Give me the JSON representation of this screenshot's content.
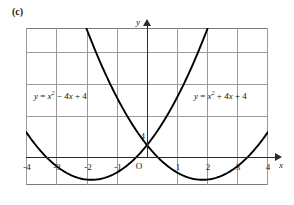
{
  "figure": {
    "part_label": "(c)",
    "background_color": "#ffffff",
    "curve_color": "#000000",
    "grid_color": "#9a9a9a",
    "frame_color": "#7a7a7a",
    "axis_color": "#2b2b2b"
  },
  "axes": {
    "x_axis_label": "x",
    "y_axis_label": "y",
    "origin_label": "O",
    "y_intercept_label": "4",
    "x_ticks": [
      "-4",
      "-3",
      "-2",
      "-1",
      "1",
      "2",
      "3",
      "4"
    ],
    "x_tick_values": [
      -4,
      -3,
      -2,
      -1,
      1,
      2,
      3,
      4
    ]
  },
  "equations": {
    "left": {
      "lhs": "y",
      "eq": "=",
      "var": "x",
      "exp": "2",
      "mid_op": "−",
      "mid_term": "4x",
      "end_op": "+",
      "constant": "4",
      "full": "y = x² − 4x + 4"
    },
    "right": {
      "lhs": "y",
      "eq": "=",
      "var": "x",
      "exp": "2",
      "mid_op": "+",
      "mid_term": "4x",
      "end_op": "+",
      "constant": "4",
      "full": "y = x² + 4x + 4"
    }
  },
  "chart_data": {
    "type": "line",
    "title": "(c)",
    "xlabel": "x",
    "ylabel": "y",
    "grid": true,
    "legend": "inline-annotations",
    "xlim": [
      -4.35,
      4.35
    ],
    "ylim": [
      -0.6,
      17.5
    ],
    "x_ticks": [
      -4,
      -3,
      -2,
      -1,
      1,
      2,
      3,
      4
    ],
    "y_ticks": [
      4,
      8,
      12,
      16
    ],
    "annotations": [
      {
        "text": "4",
        "x": 0,
        "y": 4,
        "note": "y-intercept of both parabolas"
      },
      {
        "text": "O",
        "x": 0,
        "y": 0,
        "note": "origin"
      }
    ],
    "series": [
      {
        "name": "y = x² − 4x + 4",
        "expression": "x^2 - 4x + 4",
        "vertex": [
          2,
          0
        ],
        "y_intercept": 4,
        "roots": [
          2
        ],
        "x": [
          -4,
          -3.5,
          -3,
          -2.5,
          -2,
          -1.5,
          -1,
          -0.5,
          0,
          0.5,
          1,
          1.5,
          2,
          2.5,
          3,
          3.5,
          4
        ],
        "values": [
          36,
          30.25,
          25,
          20.25,
          16,
          12.25,
          9,
          6.25,
          4,
          2.25,
          1,
          0.25,
          0,
          0.25,
          1,
          2.25,
          4
        ]
      },
      {
        "name": "y = x² + 4x + 4",
        "expression": "x^2 + 4x + 4",
        "vertex": [
          -2,
          0
        ],
        "y_intercept": 4,
        "roots": [
          -2
        ],
        "x": [
          -4,
          -3.5,
          -3,
          -2.5,
          -2,
          -1.5,
          -1,
          -0.5,
          0,
          0.5,
          1,
          1.5,
          2,
          2.5,
          3,
          3.5,
          4
        ],
        "values": [
          4,
          2.25,
          1,
          0.25,
          0,
          0.25,
          1,
          2.25,
          4,
          6.25,
          9,
          12.25,
          16,
          20.25,
          25,
          30.25,
          36
        ]
      }
    ]
  }
}
